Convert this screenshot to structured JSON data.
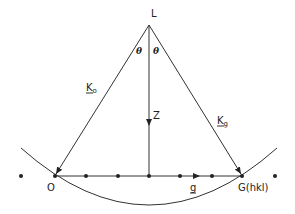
{
  "diagram": {
    "points": {
      "L": {
        "label": "L"
      },
      "O": {
        "label": "O"
      },
      "G": {
        "label": "G(hkl)"
      }
    },
    "vectors": {
      "k0": {
        "label": "K",
        "subscript": "o"
      },
      "kg": {
        "label": "K",
        "subscript": "g"
      },
      "z": {
        "label": "Z"
      },
      "g": {
        "label": "g"
      }
    },
    "angles": {
      "left": "θ",
      "right": "θ"
    },
    "reciprocal_lattice_row": {
      "point_count": 9
    }
  }
}
